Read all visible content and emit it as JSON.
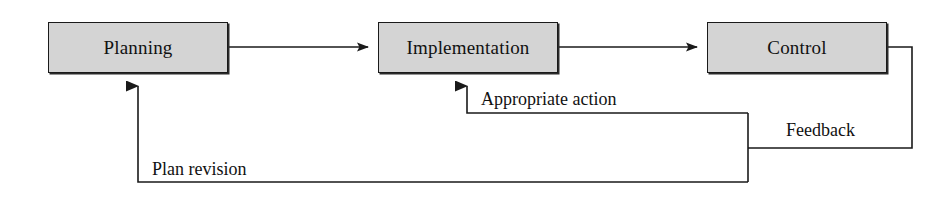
{
  "diagram": {
    "type": "flow-diagram",
    "colors": {
      "box_fill": "#d4d4d4",
      "box_border": "#1a1a1a",
      "line": "#1a1a1a",
      "text": "#111111",
      "background": "#ffffff"
    },
    "nodes": [
      {
        "id": "planning",
        "label": "Planning"
      },
      {
        "id": "implementation",
        "label": "Implementation"
      },
      {
        "id": "control",
        "label": "Control"
      }
    ],
    "edges": [
      {
        "id": "planning-to-implementation",
        "from": "planning",
        "to": "implementation",
        "label": "",
        "direction": "right"
      },
      {
        "id": "implementation-to-control",
        "from": "implementation",
        "to": "control",
        "label": "",
        "direction": "right"
      },
      {
        "id": "control-to-implementation",
        "from": "control",
        "to": "implementation",
        "label": "Appropriate action",
        "direction": "up-left"
      },
      {
        "id": "control-feedback",
        "from": "control",
        "to": "planning",
        "label": "Feedback",
        "direction": "down"
      },
      {
        "id": "control-to-planning",
        "from": "control",
        "to": "planning",
        "label": "Plan revision",
        "direction": "up-left"
      }
    ],
    "labels": {
      "appropriate_action": "Appropriate action",
      "feedback": "Feedback",
      "plan_revision": "Plan revision"
    }
  }
}
